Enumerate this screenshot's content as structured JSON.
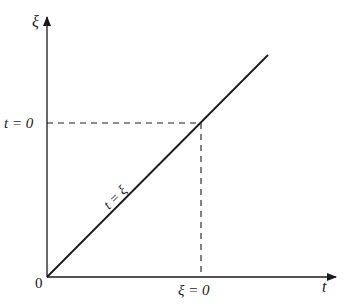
{
  "diagram": {
    "axes": {
      "vertical_label": "ξ",
      "horizontal_label": "t",
      "origin_label": "0"
    },
    "labels": {
      "t_zero": "t = 0",
      "xi_zero": "ξ = 0",
      "diagonal": "t = ξ"
    },
    "colors": {
      "stroke": "#1a1a1a",
      "background": "#ffffff"
    }
  }
}
